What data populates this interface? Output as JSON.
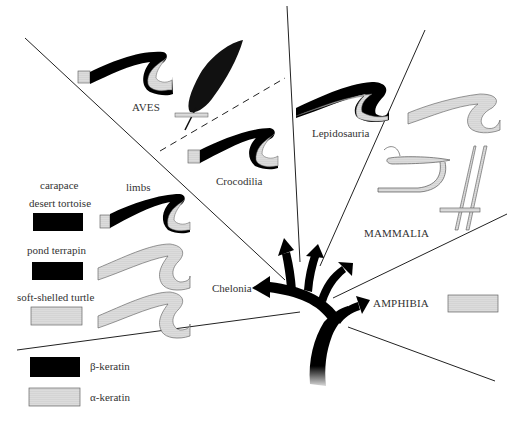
{
  "figure": {
    "clades": {
      "aves": "AVES",
      "crocodilia": "Crocodilia",
      "lepidosauria": "Lepidosauria",
      "mammalia": "MAMMALIA",
      "chelonia": "Chelonia",
      "amphibia": "AMPHIBIA"
    },
    "chelonia_panel": {
      "column_carapace": "carapace",
      "column_limbs": "limbs",
      "rows": [
        {
          "name": "desert tortoise",
          "carapace": "beta",
          "limb": "beta-with-alpha-hinge"
        },
        {
          "name": "pond terrapin",
          "carapace": "beta",
          "limb": "alpha"
        },
        {
          "name": "soft-shelled turtle",
          "carapace": "alpha",
          "limb": "alpha"
        }
      ]
    },
    "legend": {
      "items": [
        {
          "key": "beta",
          "label": "β-keratin",
          "color": "#000000"
        },
        {
          "key": "alpha",
          "label": "α-keratin",
          "color": "#e8e8e8"
        }
      ]
    },
    "icons": [
      "feather-icon",
      "scale-icon",
      "hair-icon",
      "claw-icon",
      "phylogeny-tree-icon"
    ]
  }
}
